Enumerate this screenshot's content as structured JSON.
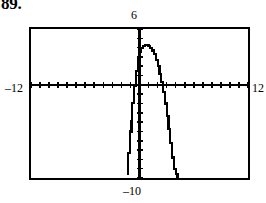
{
  "figure": {
    "exercise_number": "89.",
    "background": "#ffffff",
    "ink_color": "#000000"
  },
  "window_labels": {
    "ymax": "6",
    "xmin": "–12",
    "xmax": "12",
    "ymin": "–10"
  },
  "chart_data": {
    "type": "line",
    "title": "",
    "subtitle": "",
    "xlabel": "",
    "ylabel": "",
    "grid": false,
    "legend": null,
    "style": "graphing-calculator-viewing-window",
    "xlim": [
      -12,
      12
    ],
    "ylim": [
      -10,
      6
    ],
    "x_tick_step": 1,
    "y_tick_step": 1,
    "axes": {
      "x_axis_at_y": 0,
      "y_axis_at_x": 0,
      "tick_marks": true
    },
    "series": [
      {
        "name": "parabola",
        "description": "downward-opening parabola, vertex slightly right of the y-axis near the top of the window",
        "vertex": [
          1.4,
          4.3
        ],
        "x_intercepts": [
          -0.8,
          3.7
        ],
        "x": [
          -1.3,
          -1.1,
          -0.9,
          -0.8,
          -0.6,
          -0.4,
          -0.2,
          0.0,
          0.2,
          0.4,
          0.6,
          0.8,
          1.0,
          1.2,
          1.4,
          1.6,
          1.8,
          2.0,
          2.2,
          2.4,
          2.6,
          2.8,
          3.0,
          3.2,
          3.4,
          3.6,
          3.8,
          4.0,
          4.2,
          4.4
        ],
        "y": [
          -9.7,
          -7.3,
          -5.0,
          -3.9,
          -1.9,
          -0.1,
          1.5,
          2.9,
          3.6,
          4.0,
          4.2,
          4.3,
          4.3,
          4.2,
          4.0,
          3.7,
          3.3,
          2.7,
          2.0,
          1.2,
          0.3,
          -0.8,
          -2.0,
          -3.3,
          -4.7,
          -6.2,
          -7.8,
          -9.0,
          -9.6,
          -10.0
        ]
      }
    ]
  }
}
